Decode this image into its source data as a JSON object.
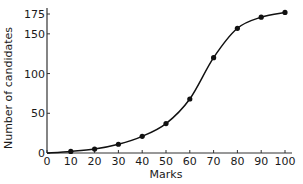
{
  "chart_data": {
    "type": "line",
    "title": "",
    "xlabel": "Marks",
    "ylabel": "Number of candidates",
    "x": [
      0,
      10,
      20,
      30,
      40,
      50,
      60,
      70,
      80,
      90,
      100
    ],
    "series": [
      {
        "name": "Cumulative frequency",
        "values": [
          0,
          2,
          5,
          11,
          21,
          37,
          68,
          120,
          157,
          171,
          177
        ],
        "markers": [
          false,
          true,
          true,
          true,
          true,
          true,
          true,
          true,
          true,
          true,
          true
        ]
      }
    ],
    "xticks": [
      0,
      10,
      20,
      30,
      40,
      50,
      60,
      70,
      80,
      90,
      100
    ],
    "yticks": [
      0,
      50,
      100,
      150,
      175
    ],
    "xlim": [
      0,
      100
    ],
    "ylim": [
      0,
      175
    ],
    "grid": false,
    "legend": null,
    "colors": {
      "line": "#111111",
      "axis": "#333333",
      "text": "#1a1a1a"
    }
  }
}
